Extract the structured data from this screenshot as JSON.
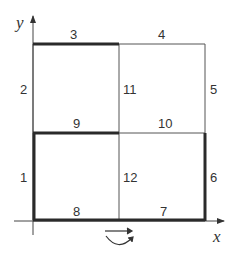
{
  "diagram": {
    "axes": {
      "x_label": "x",
      "y_label": "y"
    },
    "segments": [
      {
        "id": "1",
        "label": "1",
        "thick": true
      },
      {
        "id": "2",
        "label": "2",
        "thick": false
      },
      {
        "id": "3",
        "label": "3",
        "thick": true
      },
      {
        "id": "4",
        "label": "4",
        "thick": false
      },
      {
        "id": "5",
        "label": "5",
        "thick": false
      },
      {
        "id": "6",
        "label": "6",
        "thick": true
      },
      {
        "id": "7",
        "label": "7",
        "thick": true
      },
      {
        "id": "8",
        "label": "8",
        "thick": true
      },
      {
        "id": "9",
        "label": "9",
        "thick": true
      },
      {
        "id": "10",
        "label": "10",
        "thick": false
      },
      {
        "id": "11",
        "label": "11",
        "thick": false
      },
      {
        "id": "12",
        "label": "12",
        "thick": false
      }
    ],
    "rotation_symbol": "rotation-arrow-icon",
    "colors": {
      "thin": "#555555",
      "thick": "#2a2a2a",
      "text": "#333333"
    }
  }
}
